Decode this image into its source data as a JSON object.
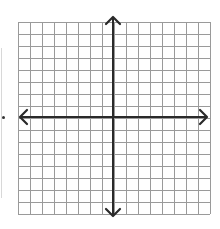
{
  "diagram": {
    "type": "coordinate-plane",
    "grid": {
      "columns": 16,
      "rows": 16,
      "cell_size_px": 12,
      "line_color": "#9a9a9a",
      "border_color": "#8a8a8a"
    },
    "axes": {
      "color": "#2a2a2a",
      "x_axis": {
        "arrows": [
          "left",
          "right"
        ]
      },
      "y_axis": {
        "arrows": [
          "up",
          "down"
        ]
      },
      "origin_cell": {
        "col": 8,
        "row": 8
      }
    },
    "labels": []
  }
}
